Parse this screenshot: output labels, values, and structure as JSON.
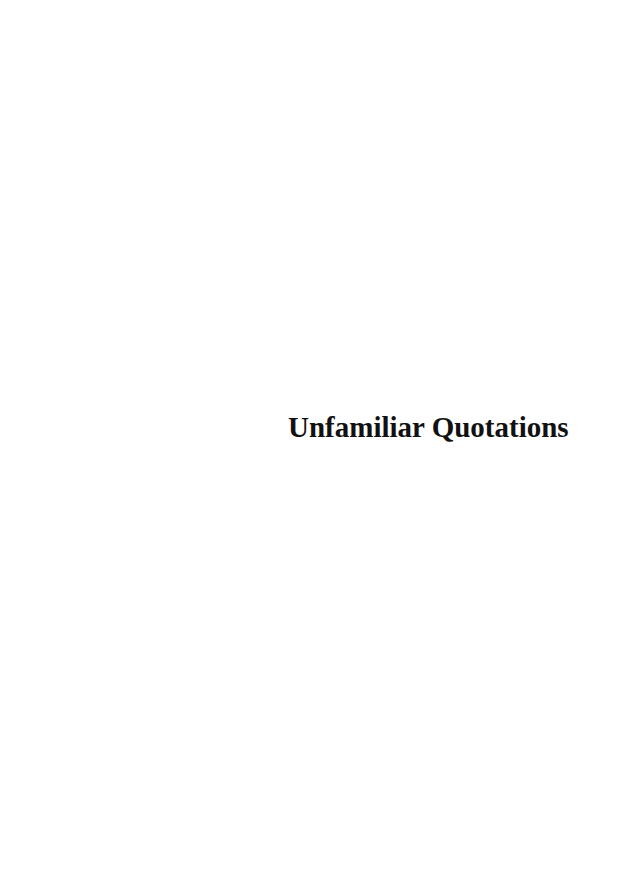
{
  "page": {
    "title": "Unfamiliar Quotations"
  }
}
